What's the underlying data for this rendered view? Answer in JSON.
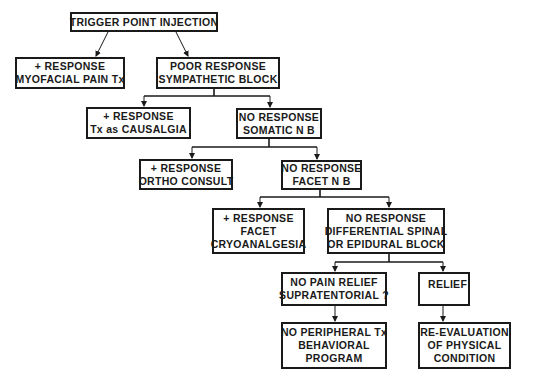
{
  "diagram": {
    "type": "flowchart",
    "colors": {
      "stroke": "#1a1a1a",
      "background": "#ffffff"
    },
    "nodes": {
      "trigger": {
        "lines": [
          "TRIGGER POINT INJECTION"
        ]
      },
      "myofacial": {
        "lines": [
          "+ RESPONSE",
          "MYOFACIAL PAIN Tx"
        ]
      },
      "sympathetic": {
        "lines": [
          "POOR RESPONSE",
          "SYMPATHETIC BLOCK"
        ]
      },
      "causalgia": {
        "lines": [
          "+ RESPONSE",
          "Tx as CAUSALGIA"
        ]
      },
      "somatic": {
        "lines": [
          "NO RESPONSE",
          "SOMATIC N B"
        ]
      },
      "ortho": {
        "lines": [
          "+ RESPONSE",
          "ORTHO CONSULT"
        ]
      },
      "facet": {
        "lines": [
          "NO RESPONSE",
          "FACET N B"
        ]
      },
      "cryo": {
        "lines": [
          "+ RESPONSE",
          "FACET",
          "CRYOANALGESIA"
        ]
      },
      "differential": {
        "lines": [
          "NO RESPONSE",
          "DIFFERENTIAL SPINAL",
          "OR EPIDURAL BLOCK"
        ]
      },
      "no_relief": {
        "lines": [
          "NO PAIN RELIEF",
          "SUPRATENTORIAL ?"
        ]
      },
      "relief": {
        "lines": [
          "RELIEF"
        ]
      },
      "no_peripheral": {
        "lines": [
          "NO PERIPHERAL Tx",
          "BEHAVIORAL",
          "PROGRAM"
        ]
      },
      "reevaluation": {
        "lines": [
          "RE-EVALUATION",
          "OF PHYSICAL",
          "CONDITION"
        ]
      }
    },
    "edges": [
      {
        "from": "trigger",
        "to": "myofacial"
      },
      {
        "from": "trigger",
        "to": "sympathetic"
      },
      {
        "from": "sympathetic",
        "to": "causalgia"
      },
      {
        "from": "sympathetic",
        "to": "somatic"
      },
      {
        "from": "somatic",
        "to": "ortho"
      },
      {
        "from": "somatic",
        "to": "facet"
      },
      {
        "from": "facet",
        "to": "cryo"
      },
      {
        "from": "facet",
        "to": "differential"
      },
      {
        "from": "differential",
        "to": "no_relief"
      },
      {
        "from": "differential",
        "to": "relief"
      },
      {
        "from": "no_relief",
        "to": "no_peripheral"
      },
      {
        "from": "relief",
        "to": "reevaluation"
      }
    ]
  }
}
